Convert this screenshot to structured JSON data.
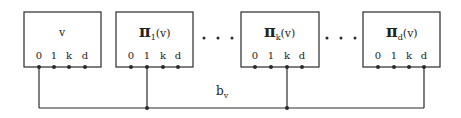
{
  "diagram": {
    "boxes": [
      {
        "id": "v",
        "symbol": "",
        "name": "v",
        "sub": "",
        "arg": "",
        "x": 24,
        "w": 77,
        "ports": [
          {
            "label": "0",
            "x": 39
          },
          {
            "label": "1",
            "x": 54
          },
          {
            "label": "k",
            "x": 69
          },
          {
            "label": "d",
            "x": 85
          }
        ],
        "connected_port": 0
      },
      {
        "id": "pi1",
        "symbol": "π",
        "name": "",
        "sub": "1",
        "arg": "(v)",
        "x": 116,
        "w": 77,
        "ports": [
          {
            "label": "0",
            "x": 131
          },
          {
            "label": "1",
            "x": 147
          },
          {
            "label": "k",
            "x": 163
          },
          {
            "label": "d",
            "x": 178
          }
        ],
        "connected_port": 1
      },
      {
        "id": "pik",
        "symbol": "π",
        "name": "",
        "sub": "k",
        "arg": "(v)",
        "x": 241,
        "w": 78,
        "ports": [
          {
            "label": "0",
            "x": 255
          },
          {
            "label": "1",
            "x": 271
          },
          {
            "label": "k",
            "x": 287
          },
          {
            "label": "d",
            "x": 302
          }
        ],
        "connected_port": 2
      },
      {
        "id": "pid",
        "symbol": "π",
        "name": "",
        "sub": "d",
        "arg": "(v)",
        "x": 363,
        "w": 77,
        "ports": [
          {
            "label": "0",
            "x": 378
          },
          {
            "label": "1",
            "x": 394
          },
          {
            "label": "k",
            "x": 409
          },
          {
            "label": "d",
            "x": 424
          }
        ],
        "connected_port": 3
      }
    ],
    "ellipses": [
      {
        "x": [
          204,
          218,
          232
        ]
      },
      {
        "x": [
          327,
          341,
          355
        ]
      }
    ],
    "bus_label": {
      "main": "b",
      "sub": "v"
    },
    "colors": {
      "line": "#2a2a2a",
      "background": "#ffffff"
    }
  },
  "labels": {
    "box_v_title": "v",
    "pi_symbol": "π",
    "pi1_sub": "1",
    "pik_sub": "k",
    "pid_sub": "d",
    "arg": "(v)",
    "bus_main": "b",
    "bus_sub": "v",
    "port_0": "0",
    "port_1": "1",
    "port_k": "k",
    "port_d": "d"
  }
}
